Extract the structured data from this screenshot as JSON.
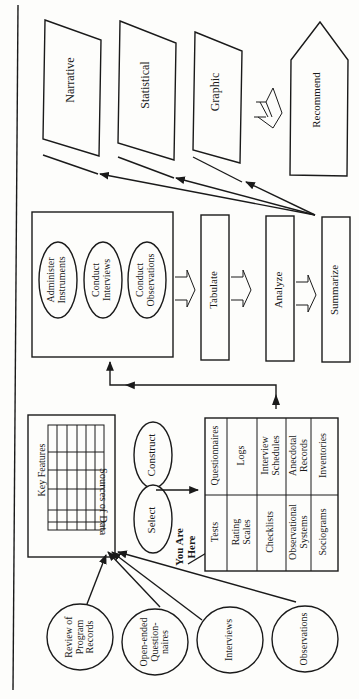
{
  "diagram": {
    "orientation": "rotated-90-ccw",
    "sources": [
      {
        "id": "review",
        "lines": [
          "Review of",
          "Program",
          "Records"
        ]
      },
      {
        "id": "open",
        "lines": [
          "Open-ended",
          "Question-",
          "naires"
        ]
      },
      {
        "id": "interviews",
        "lines": [
          "Interviews"
        ]
      },
      {
        "id": "observations",
        "lines": [
          "Observations"
        ]
      }
    ],
    "sources_box": {
      "title": "Sources of Data",
      "grid_label": "Key Features"
    },
    "choice": {
      "select": "Select",
      "construct": "Construct",
      "marker": [
        "You Are",
        "Here"
      ]
    },
    "instruments_table": {
      "left_column": [
        [
          "Tests"
        ],
        [
          "Rating",
          "Scales"
        ],
        [
          "Checklists"
        ],
        [
          "Observational",
          "Systems"
        ],
        [
          "Sociograms"
        ]
      ],
      "right_column": [
        [
          "Questionnaires"
        ],
        [
          "Logs"
        ],
        [
          "Interview",
          "Schedules"
        ],
        [
          "Anecdotal",
          "Records"
        ],
        [
          "Inventories"
        ]
      ]
    },
    "collect_box": {
      "activities": [
        [
          "Administer",
          "Instruments"
        ],
        [
          "Conduct",
          "Interviews"
        ],
        [
          "Conduct",
          "Observations"
        ]
      ]
    },
    "process_steps": [
      "Tabulate",
      "Analyze",
      "Summarize"
    ],
    "report_formats": [
      "Narrative",
      "Statistical",
      "Graphic"
    ],
    "final_step": "Recommend"
  }
}
